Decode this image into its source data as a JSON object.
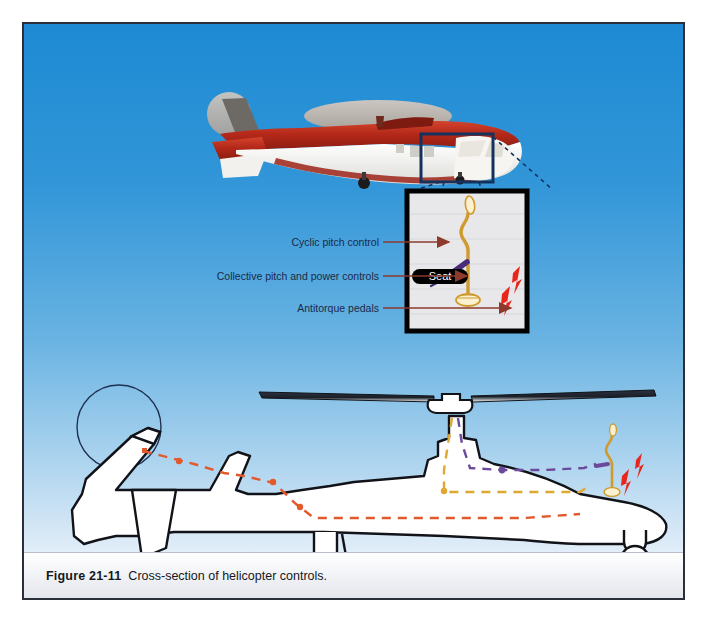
{
  "figure": {
    "caption_number": "Figure 21-11",
    "caption_text": "Cross-section of helicopter controls.",
    "background_top_color": "#1d8ad3",
    "background_bottom_color": "#ffffff",
    "panel_border_color": "#2a2f3a"
  },
  "callout": {
    "box_color": "#15325e",
    "leader_line_color": "#16325e",
    "leader_line_style": "dashed"
  },
  "inset": {
    "border_color": "#000000",
    "fill_color": "#e8e8ea",
    "seat_label": "Seat",
    "seat_color": "#000000"
  },
  "labels": [
    {
      "id": "cyclic",
      "text": "Cyclic pitch control",
      "arrow_color": "#8d3a2c"
    },
    {
      "id": "collective",
      "text": "Collective pitch and power controls",
      "arrow_color": "#8d3a2c"
    },
    {
      "id": "pedals",
      "text": "Antitorque pedals",
      "arrow_color": "#8d3a2c"
    }
  ],
  "controls": {
    "cyclic_color": "#4a2d7a",
    "collective_color": "#cf9a2e",
    "collective_grip_color": "#fbf0cf",
    "pedal_color": "#e8261c"
  },
  "top_helicopter": {
    "body_red": "#b4291a",
    "body_white": "#fdfdfd",
    "rotor_disc_color": "#b9b3ad",
    "tail_rotor_disc_color": "#bdb7b1"
  },
  "cross_section": {
    "outline_color": "#111318",
    "fill_color": "#ffffff",
    "runs": [
      {
        "name": "cyclic-run",
        "color": "#6b4a9c",
        "style": "dashed"
      },
      {
        "name": "collective-run",
        "color": "#e0a830",
        "style": "dashed"
      },
      {
        "name": "antitorque-run",
        "color": "#e2592c",
        "style": "dashed"
      }
    ]
  }
}
